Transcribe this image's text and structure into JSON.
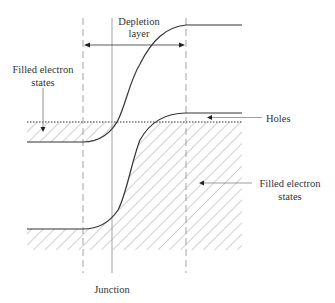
{
  "diagram": {
    "type": "pn-junction band diagram",
    "labels": {
      "depletion_line1": "Depletion",
      "depletion_line2": "layer",
      "filled_left_line1": "Filled electron",
      "filled_left_line2": "states",
      "holes": "Holes",
      "filled_right_line1": "Filled electron",
      "filled_right_line2": "states",
      "junction": "Junction"
    },
    "colors": {
      "line": "#333333",
      "hatch": "#888888",
      "guide": "#999999"
    }
  }
}
